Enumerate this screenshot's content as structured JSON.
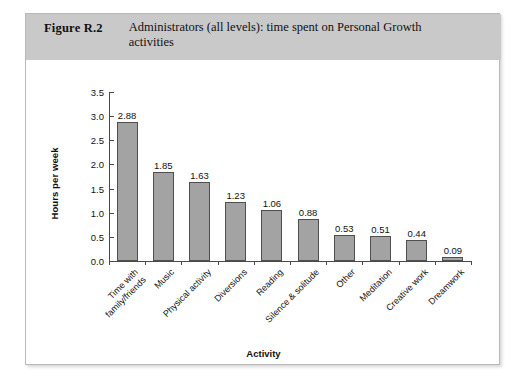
{
  "figure": {
    "number": "Figure R.2",
    "caption": "Administrators (all levels): time spent on Personal Growth activities"
  },
  "chart_data": {
    "type": "bar",
    "title": "Administrators (all levels): time spent on Personal Growth activities",
    "xlabel": "Activity",
    "ylabel": "Hours per week",
    "ylim": [
      0,
      3.5
    ],
    "yticks": [
      "0.0",
      "0.5",
      "1.0",
      "1.5",
      "2.0",
      "2.5",
      "3.0",
      "3.5"
    ],
    "grid": false,
    "legend": "none",
    "bar_color": "#a3a3a3",
    "bar_edge_color": "#4f4f4f",
    "categories": [
      "Time with family/friends",
      "Music",
      "Physical activity",
      "Diversions",
      "Reading",
      "Silence & solitude",
      "Other",
      "Meditation",
      "Creative work",
      "Dreamwork"
    ],
    "category_lines": [
      [
        "Time with",
        "family/friends"
      ],
      [
        "Music"
      ],
      [
        "Physical activity"
      ],
      [
        "Diversions"
      ],
      [
        "Reading"
      ],
      [
        "Silence & solitude"
      ],
      [
        "Other"
      ],
      [
        "Meditation"
      ],
      [
        "Creative work"
      ],
      [
        "Dreamwork"
      ]
    ],
    "values": [
      2.88,
      1.85,
      1.63,
      1.23,
      1.06,
      0.88,
      0.53,
      0.51,
      0.44,
      0.09
    ],
    "value_labels": [
      "2.88",
      "1.85",
      "1.63",
      "1.23",
      "1.06",
      "0.88",
      "0.53",
      "0.51",
      "0.44",
      "0.09"
    ]
  }
}
